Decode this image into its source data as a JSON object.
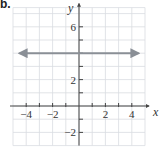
{
  "panel_label": "b.",
  "chart_data": {
    "type": "line",
    "title": "",
    "xlabel": "x",
    "ylabel": "y",
    "xlim": [
      -5,
      5
    ],
    "ylim": [
      -3,
      7
    ],
    "grid": true,
    "x_ticks": [
      -4,
      -3,
      -2,
      -1,
      1,
      2,
      3,
      4
    ],
    "x_tick_labels": [
      {
        "value": -4,
        "label": "−4"
      },
      {
        "value": -2,
        "label": "−2"
      },
      {
        "value": 2,
        "label": "2"
      },
      {
        "value": 4,
        "label": "4"
      }
    ],
    "y_ticks": [
      -2,
      -1,
      1,
      2,
      3,
      4,
      5,
      6
    ],
    "y_tick_labels": [
      {
        "value": 6,
        "label": "6"
      },
      {
        "value": 2,
        "label": "2"
      },
      {
        "value": -2,
        "label": "−2"
      }
    ],
    "series": [
      {
        "name": "y = 4",
        "x": [
          -4.5,
          4.5
        ],
        "y": [
          4,
          4
        ],
        "arrows": "both",
        "color": "#8a8f96"
      }
    ]
  }
}
